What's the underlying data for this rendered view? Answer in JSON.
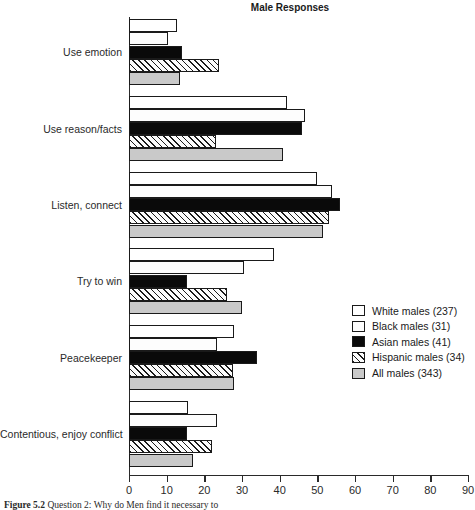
{
  "chart_data": {
    "type": "bar",
    "orientation": "horizontal",
    "title": "Male Responses",
    "xlabel": "",
    "ylabel": "",
    "xlim": [
      0,
      90
    ],
    "xticks": [
      0,
      10,
      20,
      30,
      40,
      50,
      60,
      70,
      80,
      90
    ],
    "xtick_labels": [
      "0",
      "10",
      "20",
      "30",
      "40",
      "50",
      "60",
      "70",
      "80",
      "90"
    ],
    "grid": false,
    "legend_position": "center-right",
    "categories": [
      "Use emotion",
      "Use reason/facts",
      "Listen, connect",
      "Try to win",
      "Peacekeeper",
      "Contentious, enjoy conflict"
    ],
    "series": [
      {
        "name": "White males (237)",
        "pattern": "white",
        "values": [
          12.7,
          42.0,
          50.0,
          38.5,
          28.0,
          15.6
        ]
      },
      {
        "name": "Black males (31)",
        "pattern": "stipple",
        "values": [
          10.3,
          46.7,
          54.0,
          30.5,
          23.4,
          23.4
        ]
      },
      {
        "name": "Asian males (41)",
        "pattern": "black",
        "values": [
          14.0,
          46.0,
          56.0,
          15.4,
          34.0,
          15.4
        ]
      },
      {
        "name": "Hispanic males (34)",
        "pattern": "hatch",
        "values": [
          24.0,
          23.0,
          53.0,
          26.0,
          27.6,
          22.0
        ]
      },
      {
        "name": "All males (343)",
        "pattern": "gray",
        "values": [
          13.5,
          41.0,
          51.5,
          30.0,
          28.0,
          17.0
        ]
      }
    ]
  },
  "legend": {
    "items": [
      {
        "label": "White males (237)",
        "pattern": "white"
      },
      {
        "label": "Black males (31)",
        "pattern": "stipple"
      },
      {
        "label": "Asian males (41)",
        "pattern": "black"
      },
      {
        "label": "Hispanic males (34)",
        "pattern": "hatch"
      },
      {
        "label": "All males (343)",
        "pattern": "gray"
      }
    ]
  },
  "caption": {
    "label": "Figure 5.2",
    "text": "Question 2: Why do Men find it necessary to"
  },
  "colors": {
    "axis": "#2a2a2a",
    "bar_outline": "#1a1a1a",
    "white_fill": "#ffffff",
    "black_fill": "#0a0a0a",
    "gray_fill": "#c9c9c9"
  }
}
